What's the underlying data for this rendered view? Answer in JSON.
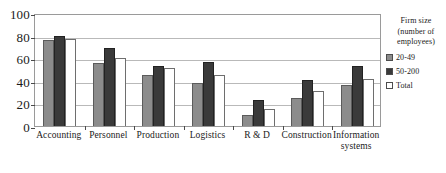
{
  "chart_data": {
    "type": "bar",
    "title": "",
    "subtitle": "",
    "xlabel": "",
    "ylabel": "",
    "ylim": [
      0,
      100
    ],
    "yticks": [
      0,
      20,
      40,
      60,
      80,
      100
    ],
    "grid": true,
    "legend_position": "right",
    "legend_title": "Firm size\n(number of\nemployees)",
    "categories": [
      "Accounting",
      "Personnel",
      "Production",
      "Logistics",
      "R & D",
      "Construction",
      "Information\nsystems"
    ],
    "series": [
      {
        "name": "20-49",
        "color": "#8c8c8c",
        "values": [
          76,
          56,
          45,
          38,
          10,
          25,
          36
        ]
      },
      {
        "name": "50-200",
        "color": "#3a3a3a",
        "values": [
          80,
          69,
          53,
          57,
          23,
          41,
          53
        ]
      },
      {
        "name": "Total",
        "color": "#ffffff",
        "values": [
          77,
          60,
          51,
          45,
          15,
          31,
          42
        ]
      }
    ]
  }
}
